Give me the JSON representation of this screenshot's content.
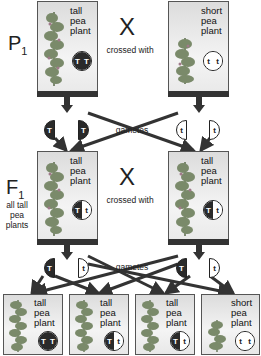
{
  "diagram": {
    "generations": {
      "p1": {
        "label": "P",
        "sub": "1"
      },
      "f1": {
        "label": "F",
        "sub": "1",
        "note": [
          "all tall",
          "pea",
          "plants"
        ]
      }
    },
    "cross_label": "X",
    "crossed_with": "crossed with",
    "gametes_label": "gametes",
    "p1_parents": [
      {
        "label": [
          "tall",
          "pea",
          "plant"
        ],
        "genotype": [
          "T",
          "T"
        ],
        "phenotype": "tall"
      },
      {
        "label": [
          "short",
          "pea",
          "plant"
        ],
        "genotype": [
          "t",
          "t"
        ],
        "phenotype": "short"
      }
    ],
    "p1_gametes": [
      "T",
      "T",
      "t",
      "t"
    ],
    "f1_parents": [
      {
        "label": [
          "tall",
          "pea",
          "plant"
        ],
        "genotype": [
          "T",
          "t"
        ],
        "phenotype": "tall"
      },
      {
        "label": [
          "tall",
          "pea",
          "plant"
        ],
        "genotype": [
          "T",
          "t"
        ],
        "phenotype": "tall"
      }
    ],
    "f1_gametes": [
      "T",
      "t",
      "T",
      "t"
    ],
    "f2_offspring": [
      {
        "label": [
          "tall",
          "pea",
          "plant"
        ],
        "genotype": [
          "T",
          "T"
        ],
        "phenotype": "tall"
      },
      {
        "label": [
          "tall",
          "pea",
          "plant"
        ],
        "genotype": [
          "T",
          "t"
        ],
        "phenotype": "tall"
      },
      {
        "label": [
          "tall",
          "pea",
          "plant"
        ],
        "genotype": [
          "T",
          "t"
        ],
        "phenotype": "tall"
      },
      {
        "label": [
          "short",
          "pea",
          "plant"
        ],
        "genotype": [
          "t",
          "t"
        ],
        "phenotype": "short"
      }
    ],
    "colors": {
      "dominant": "#2a2a2a",
      "recessive": "#ffffff",
      "plant": "#7a8a6a",
      "arrow": "#333333"
    }
  }
}
